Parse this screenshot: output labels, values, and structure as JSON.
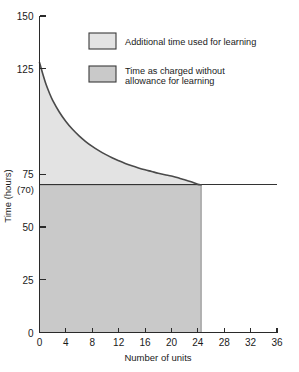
{
  "chart_data": {
    "type": "area",
    "title": "",
    "xlabel": "Number of units",
    "ylabel": "Time (hours)",
    "xlim": [
      0,
      36
    ],
    "ylim": [
      0,
      150
    ],
    "xticks": [
      0,
      4,
      8,
      12,
      16,
      20,
      24,
      28,
      32,
      36
    ],
    "xtick_labels": [
      "0",
      "4",
      "8",
      "12",
      "16",
      "20",
      "24",
      "28",
      "32",
      "36"
    ],
    "yticks": [
      0,
      25,
      50,
      75,
      150
    ],
    "ytick_labels": [
      "0",
      "25",
      "50",
      "75",
      "150"
    ],
    "ytick_top_label": "150",
    "ytick_125_label": "125",
    "y_special_label": "(70)",
    "y_special_value": 70,
    "grid": false,
    "legend_position": "upper-right",
    "series": [
      {
        "name": "Learning curve (cumulative time per unit)",
        "x": [
          0,
          0.5,
          1,
          1.5,
          2,
          3,
          4,
          5,
          6,
          7,
          8,
          9,
          10,
          11,
          12,
          13,
          14,
          15,
          16,
          17,
          18,
          19,
          20,
          21,
          22,
          23,
          24,
          24.5
        ],
        "y": [
          128,
          122.5,
          117.5,
          113.5,
          110,
          104.5,
          100,
          96.3,
          93.2,
          90.5,
          88.2,
          86.2,
          84.4,
          82.8,
          81.4,
          80.1,
          79,
          78,
          77.1,
          76.3,
          75.5,
          74.8,
          74.2,
          73.3,
          72.4,
          71.4,
          70.2,
          70
        ]
      }
    ],
    "regions": [
      {
        "name": "additional-learning-time",
        "description": "Area between learning curve and the 70 hour baseline",
        "color": "#e3e3e3",
        "x_from": 0,
        "x_to": 24.5,
        "y_lower": 70
      },
      {
        "name": "time-as-charged",
        "description": "Area below the 70 hour baseline",
        "color": "#c9c9c9",
        "x_from": 0,
        "x_to": 24.5,
        "y_lower": 0,
        "y_upper": 70
      }
    ],
    "reference_lines": [
      {
        "name": "baseline-70-hours",
        "orientation": "horizontal",
        "value": 70,
        "x_from": 0,
        "x_to": 36
      }
    ],
    "annotations": []
  },
  "legend": {
    "items": [
      {
        "label": "Additional time used for learning",
        "color": "#e3e3e3",
        "swatch_name": "legend-swatch-additional-time"
      },
      {
        "label_line1": "Time as charged without",
        "label_line2": "allowance for learning",
        "color": "#c9c9c9",
        "swatch_name": "legend-swatch-time-charged"
      }
    ]
  },
  "colors": {
    "area_light": "#e3e3e3",
    "area_dark": "#c9c9c9",
    "curve": "#4a4a4a",
    "axis": "#2a2a2a",
    "background": "#ffffff"
  }
}
